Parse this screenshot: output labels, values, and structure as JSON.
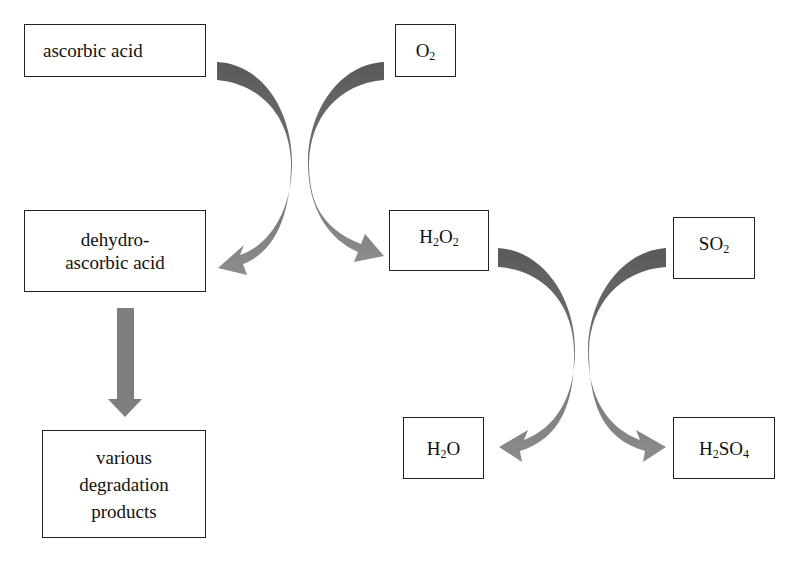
{
  "diagram": {
    "type": "reaction-scheme",
    "nodes": {
      "ascorbic_acid": {
        "label": "ascorbic acid"
      },
      "o2": {
        "base": "O",
        "sub": "2",
        "label": "O2"
      },
      "dehydroascorbic_acid": {
        "line1": "dehydro-",
        "line2": "ascorbic acid"
      },
      "h2o2": {
        "p1": "H",
        "s1": "2",
        "p2": "O",
        "s2": "2",
        "label": "H2O2"
      },
      "so2": {
        "p1": "SO",
        "s1": "2",
        "label": "SO2"
      },
      "degradation_products": {
        "line1": "various",
        "line2": "degradation",
        "line3": "products"
      },
      "h2o": {
        "p1": "H",
        "s1": "2",
        "p2": "O",
        "label": "H2O"
      },
      "h2so4": {
        "p1": "H",
        "s1": "2",
        "p2": "SO",
        "s2": "4",
        "label": "H2SO4"
      }
    },
    "edges": [
      {
        "from": "ascorbic acid",
        "to": "dehydroascorbic acid",
        "style": "curved-arrow"
      },
      {
        "from": "O2",
        "to": "H2O2",
        "style": "curved-arrow"
      },
      {
        "from": "dehydroascorbic acid",
        "to": "various degradation products",
        "style": "straight-arrow"
      },
      {
        "from": "H2O2",
        "to": "H2O",
        "style": "curved-arrow"
      },
      {
        "from": "SO2",
        "to": "H2SO4",
        "style": "curved-arrow"
      }
    ],
    "colors": {
      "arrow_dark": "#5e5e5e",
      "arrow_light": "#8a8a8a",
      "border": "#222222"
    }
  }
}
